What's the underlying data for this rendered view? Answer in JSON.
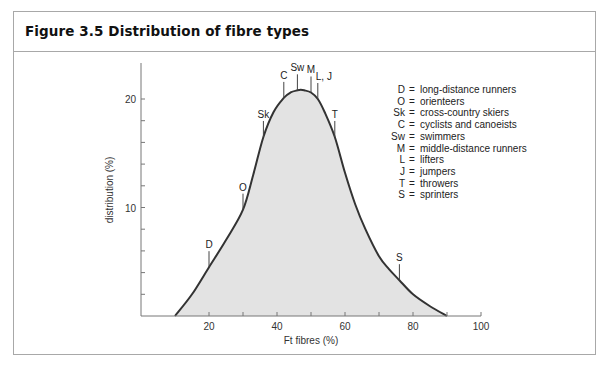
{
  "figure": {
    "title": "Figure 3.5 Distribution of fibre types"
  },
  "chart_data": {
    "type": "area",
    "title": "Figure 3.5 Distribution of fibre types",
    "xlabel": "Ft fibres (%)",
    "ylabel": "distribution (%)",
    "xlim": [
      0,
      100
    ],
    "ylim": [
      0,
      22
    ],
    "x_ticks": [
      20,
      40,
      60,
      80,
      100
    ],
    "x_minor_ticks": [
      30,
      50,
      70,
      90
    ],
    "y_ticks": [
      10,
      20
    ],
    "y_minor_ticks": [
      2,
      4,
      6,
      8,
      12,
      14,
      16,
      18
    ],
    "grid": false,
    "legend_position": "upper right (inside plot)",
    "x": [
      10,
      15,
      20,
      25,
      30,
      33,
      36,
      39,
      42,
      44,
      46,
      47,
      48,
      50,
      52,
      54,
      57,
      60,
      63,
      66,
      70,
      73,
      76,
      80,
      85,
      90
    ],
    "values": [
      0,
      2.0,
      4.5,
      7.0,
      9.8,
      13.0,
      16.5,
      18.8,
      20.1,
      20.6,
      20.8,
      20.85,
      20.8,
      20.6,
      20.0,
      18.8,
      16.5,
      13.2,
      10.3,
      8.0,
      5.5,
      4.3,
      3.3,
      2.0,
      0.9,
      0
    ],
    "annotations": [
      {
        "code": "D",
        "x": 20,
        "y": 4.5
      },
      {
        "code": "O",
        "x": 30,
        "y": 9.8
      },
      {
        "code": "Sk",
        "x": 36,
        "y": 16.5
      },
      {
        "code": "C",
        "x": 42,
        "y": 20.1
      },
      {
        "code": "Sw",
        "x": 46,
        "y": 20.8
      },
      {
        "code": "M",
        "x": 50,
        "y": 20.6
      },
      {
        "code": "L, J",
        "x": 52,
        "y": 20.0
      },
      {
        "code": "T",
        "x": 57,
        "y": 16.5
      },
      {
        "code": "S",
        "x": 76,
        "y": 3.3
      }
    ],
    "legend": [
      {
        "code": "D",
        "label": "long-distance runners"
      },
      {
        "code": "O",
        "label": "orienteers"
      },
      {
        "code": "Sk",
        "label": "cross-country skiers"
      },
      {
        "code": "C",
        "label": "cyclists and canoeists"
      },
      {
        "code": "Sw",
        "label": "swimmers"
      },
      {
        "code": "M",
        "label": "middle-distance runners"
      },
      {
        "code": "L",
        "label": "lifters"
      },
      {
        "code": "J",
        "label": "jumpers"
      },
      {
        "code": "T",
        "label": "throwers"
      },
      {
        "code": "S",
        "label": "sprinters"
      }
    ],
    "colors": {
      "curve": "#333333",
      "fill": "#e3e3e3",
      "axis": "#777777",
      "frame": "#a8a8a8"
    }
  }
}
